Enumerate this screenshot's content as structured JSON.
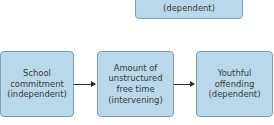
{
  "diagram": {
    "top_box": {
      "text": "(dependent)"
    },
    "boxes": [
      {
        "text": "School\ncommitment\n(independent)",
        "role": "independent"
      },
      {
        "text": "Amount of\nunstructured\nfree time\n(intervening)",
        "role": "intervening"
      },
      {
        "text": "Youthful\noffending\n(dependent)",
        "role": "dependent"
      }
    ],
    "arrows": [
      {
        "from": "School commitment",
        "to": "Amount of unstructured free time"
      },
      {
        "from": "Amount of unstructured free time",
        "to": "Youthful offending"
      }
    ],
    "colors": {
      "box_fill": "#b9d8e9",
      "box_border": "#7f9db0",
      "arrow": "#2a2a2a",
      "text": "#3a3a3a"
    }
  }
}
